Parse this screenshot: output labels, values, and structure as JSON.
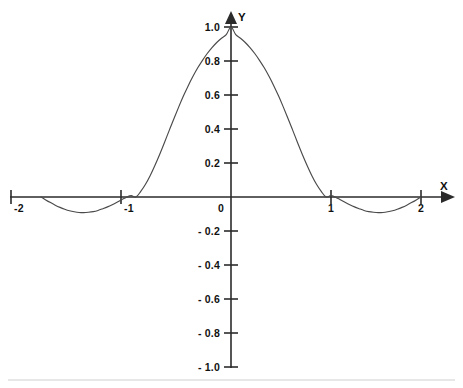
{
  "figure": {
    "name": "sinc-function-plot",
    "background_color": "#ffffff",
    "curve_color": "#4a4a4a",
    "axis_color": "#2b2b2b",
    "text_color": "#111111",
    "footer_rule_color": "#d0d0d0"
  },
  "axes": {
    "x_axis_label": "X",
    "y_axis_label": "Y",
    "x_ticks": [
      {
        "value": -2,
        "label": "-2"
      },
      {
        "value": -1,
        "label": "-1"
      },
      {
        "value": 1,
        "label": "1"
      },
      {
        "value": 2,
        "label": "2"
      }
    ],
    "origin_label": "0",
    "y_ticks": [
      {
        "value": 1.0,
        "label": "1.0"
      },
      {
        "value": 0.8,
        "label": "0.8"
      },
      {
        "value": 0.6,
        "label": "0.6"
      },
      {
        "value": 0.4,
        "label": "0.4"
      },
      {
        "value": 0.2,
        "label": "0.2"
      },
      {
        "value": -0.2,
        "label": "- 0.2"
      },
      {
        "value": -0.4,
        "label": "- 0.4"
      },
      {
        "value": -0.6,
        "label": "- 0.6"
      },
      {
        "value": -0.8,
        "label": "- 0.8"
      },
      {
        "value": -1.0,
        "label": "- 1.0"
      }
    ]
  },
  "chart_data": {
    "type": "line",
    "title": "",
    "subtitle": "",
    "xlabel": "X",
    "ylabel": "Y",
    "xlim": [
      -2.05,
      2.05
    ],
    "ylim": [
      -1.0,
      1.0
    ],
    "grid": false,
    "legend": null,
    "xticks": [
      -2,
      -1,
      0,
      1,
      2
    ],
    "xticklabels": [
      "-2",
      "-1",
      "0",
      "1",
      "2"
    ],
    "yticks": [
      -1.0,
      -0.8,
      -0.6,
      -0.4,
      -0.2,
      0,
      0.2,
      0.4,
      0.6,
      0.8,
      1.0
    ],
    "yticklabels": [
      "- 1.0",
      "- 0.8",
      "- 0.6",
      "- 0.4",
      "- 0.2",
      "0",
      "0.2",
      "0.4",
      "0.6",
      "0.8",
      "1.0"
    ],
    "series": [
      {
        "name": "sinc-like waveform",
        "color": "#4a4a4a",
        "x": [
          -2.0,
          -1.95,
          -1.9,
          -1.85,
          -1.8,
          -1.75,
          -1.7,
          -1.65,
          -1.6,
          -1.55,
          -1.5,
          -1.45,
          -1.4,
          -1.35,
          -1.3,
          -1.25,
          -1.2,
          -1.15,
          -1.1,
          -1.05,
          -1.0,
          -0.95,
          -0.9,
          -0.85,
          -0.8,
          -0.75,
          -0.7,
          -0.65,
          -0.6,
          -0.55,
          -0.5,
          -0.45,
          -0.4,
          -0.35,
          -0.3,
          -0.25,
          -0.2,
          -0.15,
          -0.1,
          -0.05,
          0.0,
          0.05,
          0.1,
          0.15,
          0.2,
          0.25,
          0.3,
          0.35,
          0.4,
          0.45,
          0.5,
          0.55,
          0.6,
          0.65,
          0.7,
          0.75,
          0.8,
          0.85,
          0.9,
          0.95,
          1.0,
          1.05,
          1.1,
          1.15,
          1.2,
          1.25,
          1.3,
          1.35,
          1.4,
          1.45,
          1.5,
          1.55,
          1.6,
          1.65,
          1.7,
          1.75,
          1.8,
          1.85,
          1.9,
          1.95,
          2.0
        ],
        "y": [
          0.0,
          -0.017,
          -0.033,
          -0.048,
          -0.061,
          -0.072,
          -0.081,
          -0.087,
          -0.091,
          -0.092,
          -0.09,
          -0.086,
          -0.079,
          -0.069,
          -0.058,
          -0.045,
          -0.031,
          -0.016,
          -0.001,
          0.008,
          0.0,
          0.033,
          0.075,
          0.127,
          0.187,
          0.252,
          0.321,
          0.392,
          0.462,
          0.53,
          0.595,
          0.655,
          0.71,
          0.76,
          0.804,
          0.844,
          0.879,
          0.909,
          0.934,
          0.955,
          1.0,
          0.955,
          0.934,
          0.909,
          0.879,
          0.844,
          0.804,
          0.76,
          0.71,
          0.655,
          0.595,
          0.53,
          0.462,
          0.392,
          0.321,
          0.252,
          0.187,
          0.127,
          0.075,
          0.033,
          0.0,
          0.008,
          -0.001,
          -0.016,
          -0.031,
          -0.045,
          -0.058,
          -0.069,
          -0.079,
          -0.086,
          -0.09,
          -0.092,
          -0.091,
          -0.087,
          -0.081,
          -0.072,
          -0.061,
          -0.048,
          -0.033,
          -0.017,
          0.0
        ],
        "annotations": {
          "peak": {
            "x": 0,
            "y": 1.0
          },
          "zero_crossings": [
            -1,
            1
          ],
          "side_lobe_minima": [
            {
              "x": -1.55,
              "y": -0.092
            },
            {
              "x": 1.55,
              "y": -0.092
            }
          ],
          "endpoints": [
            {
              "x": -2,
              "y": 0
            },
            {
              "x": 2,
              "y": 0
            }
          ]
        }
      }
    ]
  }
}
